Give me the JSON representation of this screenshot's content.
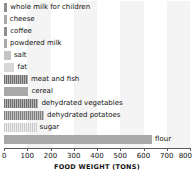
{
  "chart_data": {
    "type": "bar",
    "orientation": "horizontal",
    "title": "",
    "xlabel": "FOOD WEIGHT (TONS)",
    "ylabel": "",
    "xlim": [
      0,
      800
    ],
    "xticks": [
      0,
      100,
      200,
      300,
      400,
      500,
      600,
      700,
      800
    ],
    "xtick_labels": [
      "0",
      "100",
      "200",
      "300",
      "400",
      "500",
      "600",
      "700",
      "800"
    ],
    "grid": false,
    "legend": "none",
    "categories": [
      "whole milk for children",
      "cheese",
      "coffee",
      "powdered milk",
      "salt",
      "fat",
      "meat and fish",
      "cereal",
      "dehydrated vegetables",
      "dehydrated potatoes",
      "sugar",
      "flour"
    ],
    "values": [
      14,
      12,
      14,
      13,
      30,
      45,
      103,
      105,
      148,
      172,
      140,
      637
    ],
    "bars": [
      {
        "label": "whole milk for children",
        "value": 14,
        "style": "solid-dark"
      },
      {
        "label": "cheese",
        "value": 12,
        "style": "solid-mid"
      },
      {
        "label": "coffee",
        "value": 14,
        "style": "solid-dark"
      },
      {
        "label": "powdered milk",
        "value": 13,
        "style": "solid-mid"
      },
      {
        "label": "salt",
        "value": 30,
        "style": "solid-light"
      },
      {
        "label": "fat",
        "value": 45,
        "style": "solid-pale"
      },
      {
        "label": "meat and fish",
        "value": 103,
        "style": "hatch-dark"
      },
      {
        "label": "cereal",
        "value": 105,
        "style": "solid-mid"
      },
      {
        "label": "dehydrated vegetables",
        "value": 148,
        "style": "hatch-dark"
      },
      {
        "label": "dehydrated potatoes",
        "value": 172,
        "style": "hatch-mid"
      },
      {
        "label": "sugar",
        "value": 140,
        "style": "hatch-pale"
      },
      {
        "label": "flour",
        "value": 637,
        "style": "solid-mid"
      }
    ],
    "colors": {
      "bar_dark": "#8d8d8d",
      "bar_mid": "#a8a8a8",
      "bar_light": "#c4c4c4",
      "bar_pale": "#d8d8d8",
      "axis": "#5a5a5a",
      "text": "#111111",
      "background": "#ffffff",
      "band": "#f4f4f4"
    }
  }
}
